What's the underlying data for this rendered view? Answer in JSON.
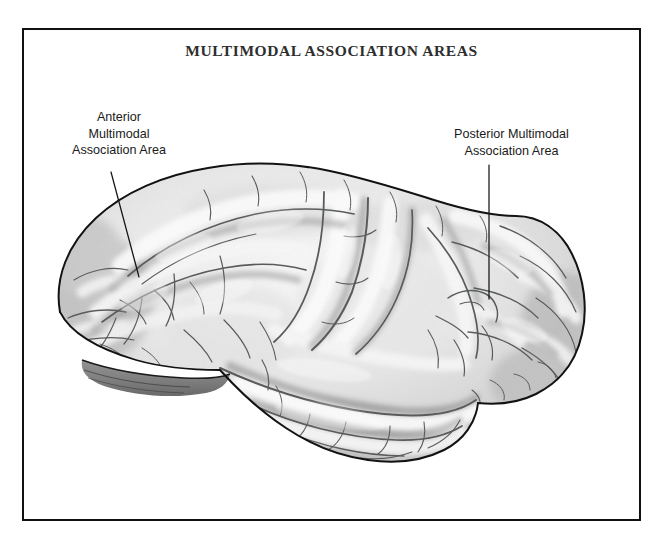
{
  "figure": {
    "title": "MULTIMODAL ASSOCIATION AREAS",
    "style": "grayscale pencil / graphite illustration",
    "background_color": "#ffffff",
    "frame_color": "#111111",
    "title_color": "#2e2e2e",
    "label_color": "#1a1a1a",
    "leader_line_color": "#141414"
  },
  "labels": [
    {
      "id": "anterior",
      "text": "Anterior\nMultimodal\nAssociation Area",
      "lines": [
        "Anterior",
        "Multimodal",
        "Association Area"
      ],
      "leader": "diagonal line from lower-right of text down-right to prefrontal cortex"
    },
    {
      "id": "posterior",
      "text": "Posterior Multimodal\nAssociation Area",
      "lines": [
        "Posterior Multimodal",
        "Association Area"
      ],
      "leader": "vertical line from below text down to parieto-temporo-occipital junction"
    }
  ],
  "brain": {
    "orientation": "left lateral view, frontal pole at left, occipital pole at right",
    "shading": {
      "gyri_highlight": "#f2f2f2",
      "sulci_shadow": "#6e6e6e",
      "outline": "#1e1e1e",
      "mid_tone": "#b8b8b8",
      "deep_shadow": "#555555"
    }
  }
}
